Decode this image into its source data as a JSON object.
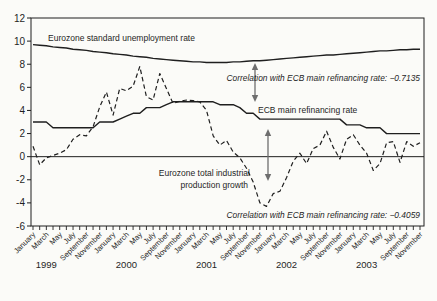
{
  "chart_data": {
    "type": "line",
    "title": "",
    "xlabel": "",
    "ylabel": "",
    "ylim": [
      -6,
      12
    ],
    "y_ticks": [
      12,
      10,
      8,
      6,
      4,
      2,
      0,
      -2,
      -4,
      -6
    ],
    "x_unit": "month",
    "x_range": [
      "January 1999",
      "November 2003"
    ],
    "years": [
      "1999",
      "2000",
      "2001",
      "2002",
      "2003"
    ],
    "month_tick_labels": [
      "January",
      "March",
      "May",
      "July",
      "September",
      "November"
    ],
    "grid": "zero-line-only",
    "legend": "inline-annotations",
    "series": [
      {
        "id": "unemployment",
        "name": "Eurozone standard unemployment rate",
        "line_style": "solid",
        "values": [
          9.7,
          9.65,
          9.6,
          9.5,
          9.45,
          9.4,
          9.3,
          9.25,
          9.2,
          9.1,
          9.05,
          9.0,
          8.9,
          8.85,
          8.8,
          8.7,
          8.65,
          8.6,
          8.5,
          8.45,
          8.4,
          8.35,
          8.3,
          8.25,
          8.2,
          8.2,
          8.15,
          8.15,
          8.15,
          8.15,
          8.2,
          8.2,
          8.25,
          8.3,
          8.3,
          8.35,
          8.4,
          8.45,
          8.5,
          8.55,
          8.6,
          8.65,
          8.7,
          8.75,
          8.8,
          8.8,
          8.85,
          8.9,
          8.95,
          9.0,
          9.05,
          9.1,
          9.15,
          9.15,
          9.2,
          9.25,
          9.25,
          9.3,
          9.3
        ]
      },
      {
        "id": "ecb-rate",
        "name": "ECB main refinancing rate",
        "line_style": "solid",
        "values": [
          3.0,
          3.0,
          3.0,
          2.5,
          2.5,
          2.5,
          2.5,
          2.5,
          2.5,
          2.5,
          3.0,
          3.0,
          3.0,
          3.25,
          3.5,
          3.75,
          3.75,
          4.25,
          4.25,
          4.25,
          4.5,
          4.75,
          4.75,
          4.75,
          4.75,
          4.75,
          4.75,
          4.75,
          4.5,
          4.5,
          4.5,
          4.25,
          3.75,
          3.75,
          3.25,
          3.25,
          3.25,
          3.25,
          3.25,
          3.25,
          3.25,
          3.25,
          3.25,
          3.25,
          3.25,
          3.25,
          3.25,
          2.75,
          2.75,
          2.75,
          2.5,
          2.5,
          2.5,
          2.0,
          2.0,
          2.0,
          2.0,
          2.0,
          2.0
        ]
      },
      {
        "id": "industrial-production",
        "name": "Eurozone total industrial production growth",
        "line_style": "dashed",
        "values": [
          0.9,
          -0.7,
          -0.1,
          0.1,
          0.3,
          0.6,
          1.5,
          1.9,
          1.8,
          2.6,
          4.3,
          5.6,
          3.6,
          5.9,
          5.7,
          6.1,
          7.8,
          5.2,
          4.9,
          7.2,
          5.9,
          4.6,
          4.8,
          4.9,
          4.85,
          4.75,
          4.0,
          1.8,
          1.0,
          1.4,
          0.4,
          -0.1,
          -1.0,
          -2.2,
          -4.0,
          -4.3,
          -3.2,
          -3.0,
          -1.8,
          -0.4,
          0.3,
          -0.6,
          0.7,
          1.0,
          2.2,
          0.8,
          -0.2,
          1.5,
          1.9,
          1.0,
          0.3,
          -1.2,
          -0.6,
          1.2,
          1.3,
          -0.5,
          1.3,
          0.9,
          1.2
        ]
      }
    ],
    "annotations": [
      {
        "name": "unemployment",
        "text": "Eurozone standard unemployment rate",
        "x": 48,
        "y": 41,
        "anchor": "start",
        "italic": false
      },
      {
        "name": "correlation-unemployment",
        "text": "Correlation with ECB main refinancing rate: −0.7135",
        "x": 420,
        "y": 81,
        "anchor": "end",
        "italic": true
      },
      {
        "name": "ecb-rate",
        "text": "ECB main refinancing rate",
        "x": 258,
        "y": 113,
        "anchor": "start",
        "italic": false
      },
      {
        "name": "industrial-line1",
        "text": "Eurozone total industrial",
        "x": 250,
        "y": 176,
        "anchor": "end",
        "italic": false
      },
      {
        "name": "industrial-line2",
        "text": "production growth",
        "x": 248,
        "y": 188,
        "anchor": "end",
        "italic": false
      },
      {
        "name": "correlation-industrial",
        "text": "Correlation with ECB main refinancing rate: −0.4059",
        "x": 420,
        "y": 218,
        "anchor": "end",
        "italic": true
      }
    ],
    "arrows": [
      {
        "name": "gap-arrow-upper",
        "x": 255,
        "y1": 63,
        "y2": 102
      },
      {
        "name": "gap-arrow-lower",
        "x": 268,
        "y1": 129,
        "y2": 181
      }
    ],
    "colors": {
      "ink": "#1f1f1f",
      "arrow": "#6e6e6e",
      "background": "#fbfbf8"
    }
  }
}
